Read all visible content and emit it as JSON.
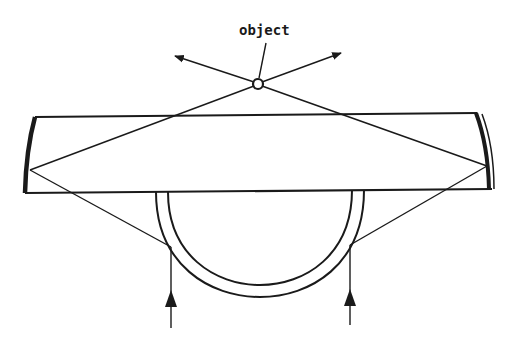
{
  "diagram": {
    "type": "optical ray diagram",
    "labels": {
      "object": "object"
    },
    "colors": {
      "ink": "#1a1a1a",
      "background": "#ffffff"
    },
    "elements": {
      "object_point": {
        "cx": 258,
        "cy": 84,
        "r": 5
      },
      "slab": {
        "top_y": 117,
        "bottom_y": 191,
        "left_x": 30,
        "right_x": 487
      },
      "left_mirror": "curved reflector on left edge of slab",
      "right_mirror": "curved reflector on right edge of slab",
      "bottom_dome": "hemispherical shell beneath slab",
      "input_arrows": 2,
      "output_arrows": 2
    }
  }
}
